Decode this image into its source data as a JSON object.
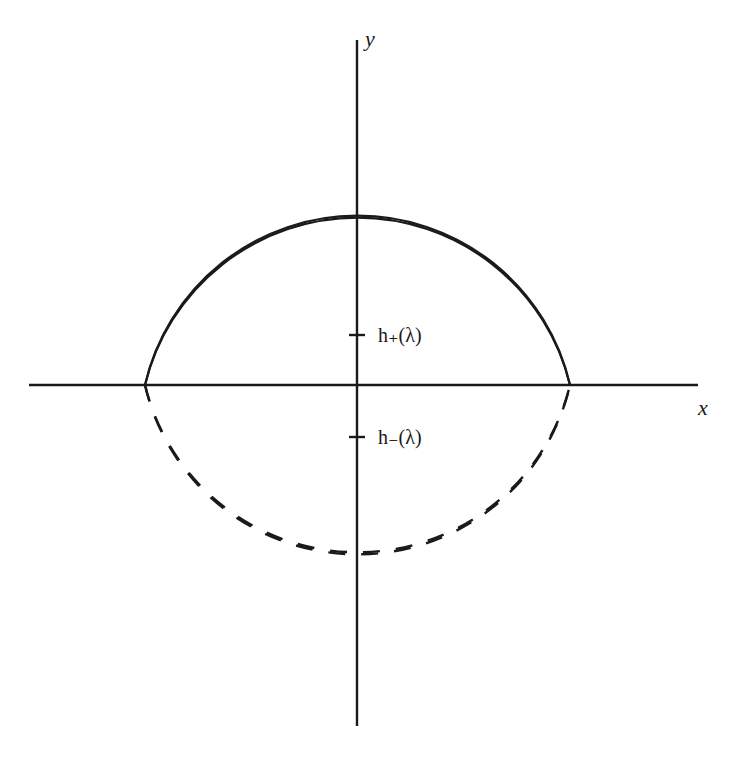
{
  "figure": {
    "axes": {
      "x_label": "x",
      "y_label": "y"
    },
    "markers": [
      {
        "label": "h₊(λ)",
        "position": "above x-axis on y-axis"
      },
      {
        "label": "h₋(λ)",
        "position": "below x-axis on y-axis"
      }
    ],
    "curves": [
      {
        "name": "outer-arc-upper",
        "style": "solid"
      },
      {
        "name": "inner-arc-upper",
        "style": "solid"
      },
      {
        "name": "outer-arc-lower",
        "style": "dashed"
      },
      {
        "name": "inner-arc-lower",
        "style": "dashed"
      }
    ],
    "colors": {
      "ink": "#1a1a1a",
      "background": "#ffffff"
    }
  }
}
